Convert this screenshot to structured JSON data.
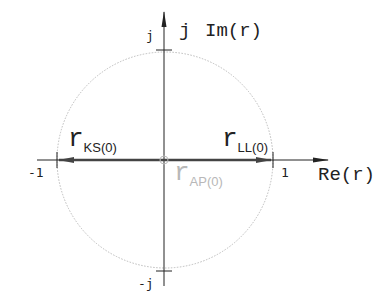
{
  "diagram": {
    "type": "complex-plane-unit-circle",
    "axes": {
      "real_label": "Re(r)",
      "imag_prefix": "j",
      "imag_label": "Im(r)"
    },
    "ticks": {
      "neg_one": "-1",
      "pos_one": "1",
      "pos_j": "j",
      "neg_j": "-j"
    },
    "vectors": [
      {
        "name": "r_KS(0)",
        "main": "r",
        "sub": "KS(0)",
        "direction": "to -1",
        "color": "#555555"
      },
      {
        "name": "r_LL(0)",
        "main": "r",
        "sub": "LL(0)",
        "direction": "to +1",
        "color": "#555555"
      },
      {
        "name": "r_AP(0)",
        "main": "r",
        "sub": "AP(0)",
        "direction": "origin",
        "color": "#b8b8b8"
      }
    ],
    "colors": {
      "axis": "#222222",
      "vector": "#555555",
      "circle": "#bbbbbb",
      "faded_label": "#b8b8b8"
    }
  }
}
